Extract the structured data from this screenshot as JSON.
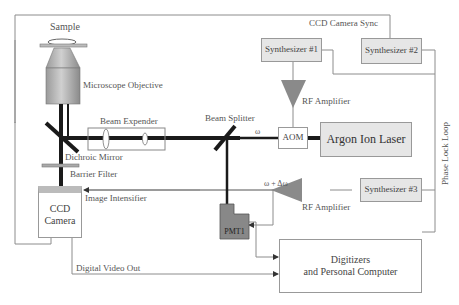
{
  "labels": {
    "sample": "Sample",
    "microscope_objective": "Microscope Objective",
    "beam_expender": "Beam Expender",
    "beam_splitter": "Beam Splitter",
    "omega": "ω",
    "omega_plus_delta": "ω +  Δω",
    "dichroic_mirror": "Dichroic Mirror",
    "barrier_filter": "Barrier Filter",
    "image_intensifier": "Image Intensifier",
    "digital_video_out": "Digital Video Out",
    "ccd_camera_sync": "CCD Camera Sync",
    "rf_amplifier_top": "RF Amplifier",
    "rf_amplifier_bottom": "RF Amplifier",
    "phase_lock_loop": "Phase Lock Loop"
  },
  "boxes": {
    "synth1": "Synthesizer #1",
    "synth2": "Synthesizer #2",
    "synth3": "Synthesizer #3",
    "aom": "AOM",
    "argon_laser": "Argon Ion Laser",
    "ccd_camera_line1": "CCD",
    "ccd_camera_line2": "Camera",
    "pmt": "PMT1",
    "digitizers_line1": "Digitizers",
    "digitizers_line2": "and Personal Computer"
  },
  "colors": {
    "beam": "#1a1a1a",
    "amplifier": "#8a8a8a",
    "pmt": "#888888",
    "line": "#8c8c8c"
  }
}
